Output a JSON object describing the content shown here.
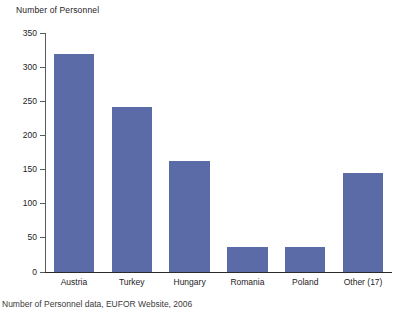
{
  "chart_data": {
    "type": "bar",
    "title": "Number of Personnel",
    "xlabel": "",
    "ylabel": "Number of Personnel",
    "categories": [
      "Austria",
      "Turkey",
      "Hungary",
      "Romania",
      "Poland",
      "Other (17)"
    ],
    "values": [
      320,
      242,
      162,
      36,
      36,
      145
    ],
    "ylim": [
      0,
      350
    ],
    "yticks": [
      0,
      50,
      100,
      150,
      200,
      250,
      300,
      350
    ],
    "ytick_labels": [
      "0",
      "50",
      "100",
      "150",
      "200",
      "250",
      "300",
      "350"
    ],
    "grid": false,
    "legend": null,
    "bar_color": "#5b6ba8",
    "axis_color": "#555c60",
    "series": [
      {
        "name": "Number of Personnel",
        "values": [
          320,
          242,
          162,
          36,
          36,
          145
        ]
      }
    ]
  },
  "caption": {
    "source_text": "Number of Personnel data, EUFOR Website, 2006"
  }
}
